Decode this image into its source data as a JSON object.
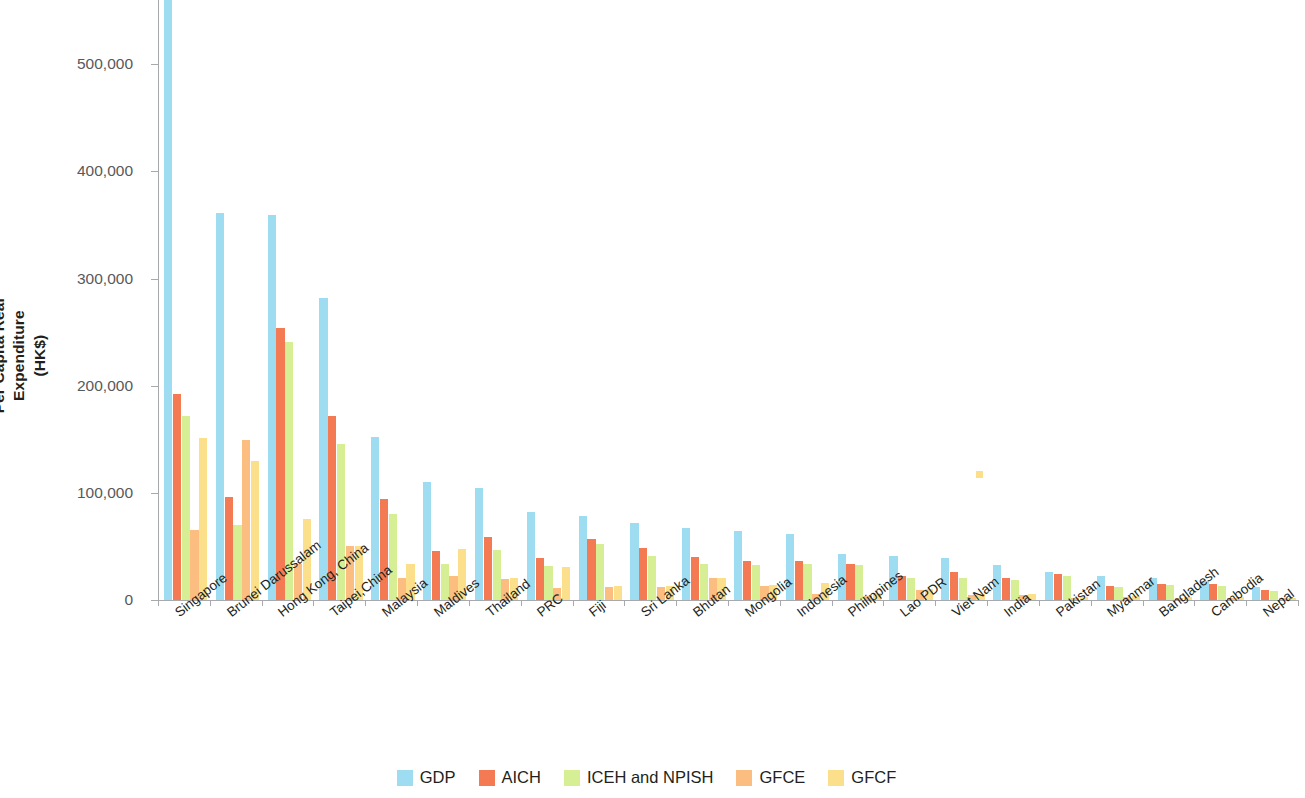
{
  "chart_data": {
    "type": "bar",
    "title": "",
    "subtitle": "",
    "xlabel": "",
    "ylabel": "Per Capita Real Expenditure\n(HK$)",
    "ylabel_line1": "Per Capita Real Expenditure",
    "ylabel_line2": "(HK$)",
    "ylim": [
      0,
      560000
    ],
    "yticks": [
      0,
      100000,
      200000,
      300000,
      400000,
      500000
    ],
    "ytick_labels": [
      "0",
      "100,000",
      "200,000",
      "300,000",
      "400,000",
      "500,000"
    ],
    "grid": false,
    "legend_position": "bottom",
    "categories": [
      "Singapore",
      "Brunei Darussalam",
      "Hong Kong, China",
      "Taipei,China",
      "Malaysia",
      "Maldives",
      "Thailand",
      "PRC",
      "Fiji",
      "Sri Lanka",
      "Bhutan",
      "Mongolia",
      "Indonesia",
      "Philippines",
      "Lao PDR",
      "Viet Nam",
      "India",
      "Pakistan",
      "Myanmar",
      "Bangladesh",
      "Cambodia",
      "Nepal"
    ],
    "series": [
      {
        "name": "GDP",
        "color": "#9edcf2",
        "values": [
          562000,
          361000,
          359000,
          282000,
          152000,
          110000,
          105000,
          82000,
          78000,
          72000,
          67000,
          64000,
          62000,
          43000,
          41000,
          39000,
          33000,
          26000,
          22000,
          21000,
          18000,
          12000
        ]
      },
      {
        "name": "AICH",
        "color": "#f37a52",
        "values": [
          192000,
          96000,
          254000,
          172000,
          94000,
          46000,
          59000,
          39000,
          57000,
          49000,
          40000,
          36000,
          36000,
          34000,
          22000,
          26000,
          21000,
          24000,
          13000,
          15000,
          15000,
          9000
        ]
      },
      {
        "name": "ICEH and NPISH",
        "color": "#d7ef94",
        "values": [
          172000,
          70000,
          241000,
          146000,
          80000,
          34000,
          47000,
          32000,
          52000,
          41000,
          34000,
          33000,
          34000,
          33000,
          21000,
          21000,
          19000,
          22000,
          12000,
          14000,
          13000,
          8000
        ]
      },
      {
        "name": "GFCE",
        "color": "#fbbd80",
        "values": [
          65000,
          149000,
          34000,
          50000,
          21000,
          22000,
          20000,
          11000,
          12000,
          12000,
          21000,
          13000,
          6000,
          4000,
          9000,
          5000,
          5000,
          2000,
          3000,
          2000,
          2000,
          1500
        ]
      },
      {
        "name": "GFCF",
        "color": "#fcdf8a",
        "values": [
          151000,
          130000,
          76000,
          50000,
          34000,
          48000,
          21000,
          31000,
          13000,
          13000,
          21000,
          14000,
          16000,
          7000,
          10000,
          6000,
          6000,
          2500,
          4000,
          3000,
          2500,
          1500
        ]
      }
    ],
    "annotations": [
      {
        "name": "orphan-gfcf-mark",
        "x_category": "Viet Nam",
        "y": 120000,
        "color": "#fcdf8a"
      }
    ]
  },
  "legend": {
    "items": [
      {
        "label": "GDP",
        "color": "#9edcf2"
      },
      {
        "label": "AICH",
        "color": "#f37a52"
      },
      {
        "label": "ICEH and NPISH",
        "color": "#d7ef94"
      },
      {
        "label": "GFCE",
        "color": "#fbbd80"
      },
      {
        "label": "GFCF",
        "color": "#fcdf8a"
      }
    ]
  }
}
